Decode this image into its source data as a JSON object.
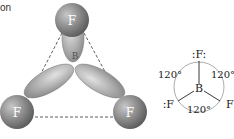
{
  "caption_fragment": "on",
  "model": {
    "central_atom": "B",
    "outer_atoms": [
      "F",
      "F",
      "F"
    ],
    "shape": "trigonal planar"
  },
  "lewis": {
    "central_atom": "B",
    "top_atom": ":F:",
    "left_atom": ":F",
    "right_atom": "F",
    "angles": [
      "120°",
      "120°",
      "120°"
    ]
  }
}
